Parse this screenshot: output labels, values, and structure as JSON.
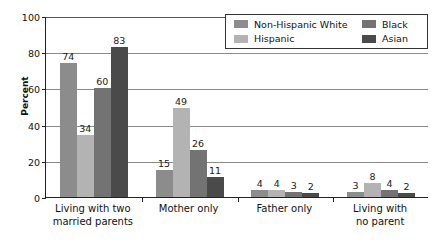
{
  "chart_data": {
    "type": "bar",
    "title": "",
    "subtitle": "",
    "xlabel": "",
    "ylabel": "Percent",
    "ylim": [
      0,
      100
    ],
    "yticks": [
      0,
      20,
      40,
      60,
      80,
      100
    ],
    "grid": true,
    "legend_position": "top-right-inside",
    "categories": [
      "Living with two married parents",
      "Mother only",
      "Father only",
      "Living with no parent"
    ],
    "category_lines": [
      [
        "Living with two",
        "married parents"
      ],
      [
        "Mother only",
        ""
      ],
      [
        "Father only",
        ""
      ],
      [
        "Living with",
        "no parent"
      ]
    ],
    "series": [
      {
        "name": "Non-Hispanic White",
        "color": "#8c8c8c",
        "values": [
          74,
          15,
          4,
          3
        ]
      },
      {
        "name": "Hispanic",
        "color": "#b3b3b3",
        "values": [
          34,
          49,
          4,
          8
        ]
      },
      {
        "name": "Black",
        "color": "#737373",
        "values": [
          60,
          26,
          3,
          4
        ]
      },
      {
        "name": "Asian",
        "color": "#4a4a4a",
        "values": [
          83,
          11,
          2,
          2
        ]
      }
    ],
    "value_labels": {
      "Living with two married parents": [
        74,
        34,
        60,
        83
      ],
      "Mother only": [
        15,
        49,
        26,
        11
      ],
      "Father only": [
        4,
        4,
        3,
        2
      ],
      "Living with no parent": [
        3,
        8,
        4,
        2
      ]
    }
  },
  "axis": {
    "y_title": "Percent",
    "y_tick_labels": [
      "0",
      "20",
      "40",
      "60",
      "80",
      "100"
    ]
  },
  "legend": {
    "entries": [
      {
        "label": "Non-Hispanic White",
        "color": "#8c8c8c"
      },
      {
        "label": "Black",
        "color": "#737373"
      },
      {
        "label": "Hispanic",
        "color": "#b3b3b3"
      },
      {
        "label": "Asian",
        "color": "#4a4a4a"
      }
    ]
  },
  "colors": {
    "axis": "#222222",
    "grid": "#8a8a8a",
    "text": "#111111",
    "background": "#ffffff"
  }
}
